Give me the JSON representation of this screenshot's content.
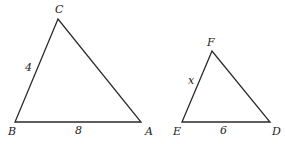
{
  "diagram": {
    "stroke_color": "#2a2a2a",
    "triangles": [
      {
        "name": "ABC",
        "vertices": {
          "A": {
            "label": "A",
            "x": 141,
            "y": 122,
            "lx": 145,
            "ly": 135
          },
          "B": {
            "label": "B",
            "x": 15,
            "y": 122,
            "lx": 8,
            "ly": 135
          },
          "C": {
            "label": "C",
            "x": 58,
            "y": 19,
            "lx": 55,
            "ly": 13
          }
        },
        "side_labels": [
          {
            "side": "BC",
            "text": "4",
            "x": 25,
            "y": 71
          },
          {
            "side": "BA",
            "text": "8",
            "x": 75,
            "y": 134
          }
        ]
      },
      {
        "name": "DEF",
        "vertices": {
          "D": {
            "label": "D",
            "x": 270,
            "y": 122,
            "lx": 272,
            "ly": 135
          },
          "E": {
            "label": "E",
            "x": 182,
            "y": 122,
            "lx": 173,
            "ly": 135
          },
          "F": {
            "label": "F",
            "x": 212,
            "y": 51,
            "lx": 207,
            "ly": 46
          }
        },
        "side_labels": [
          {
            "side": "EF",
            "text": "x",
            "x": 188,
            "y": 84
          },
          {
            "side": "ED",
            "text": "6",
            "x": 220,
            "y": 134
          }
        ]
      }
    ]
  }
}
